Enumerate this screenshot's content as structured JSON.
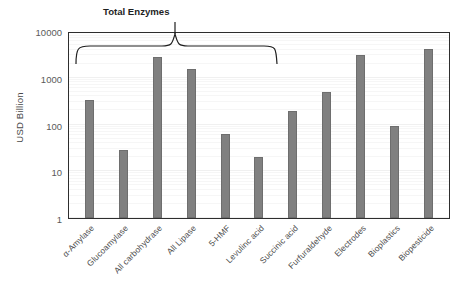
{
  "chart_data": {
    "type": "bar",
    "title": "",
    "xlabel": "",
    "ylabel": "USD Billion",
    "yscale": "log",
    "ylim": [
      1,
      10000
    ],
    "ytick_labels": [
      "10000",
      "1000",
      "100",
      "10",
      "1"
    ],
    "ytick_values": [
      10000,
      1000,
      100,
      10,
      1
    ],
    "grid": true,
    "legend": false,
    "categories": [
      "α-Amylase",
      "Glucoamylase",
      "All carbohydrase",
      "All Lipase",
      "5-HMF",
      "Levulinc acid",
      "Succinic acid",
      "Furfuraldehyde",
      "Electrodes",
      "Bioplastics",
      "Biopesticide"
    ],
    "values": [
      330,
      29,
      2800,
      1550,
      62,
      20,
      190,
      500,
      3000,
      92,
      4200
    ],
    "bar_color": "#808080",
    "annotations": [
      {
        "text": "Total Enzymes",
        "type": "brace",
        "spans_categories": [
          "α-Amylase",
          "All Lipase"
        ]
      }
    ]
  },
  "axis": {
    "y_title": "USD Billion"
  },
  "annotation": {
    "total_enzymes_label": "Total Enzymes"
  }
}
